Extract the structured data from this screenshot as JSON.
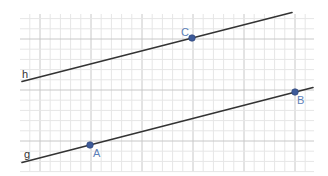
{
  "diagram": {
    "type": "geometry-parallel-lines",
    "grid": {
      "x_start": 20,
      "x_end": 314,
      "y_start": 14,
      "y_end": 172,
      "minor_step": 10.2,
      "major_every": 5,
      "major_x_origin": 40,
      "major_y_origin": 39,
      "minor_color": "#e6e6e6",
      "major_color": "#c8c8c8"
    },
    "lines": [
      {
        "name": "h",
        "label": "h",
        "x1": 22,
        "y1": 81.5,
        "x2": 292,
        "y2": 12.5,
        "label_x": 22,
        "label_y": 78,
        "color": "#333333"
      },
      {
        "name": "g",
        "label": "g",
        "x1": 22,
        "y1": 162.5,
        "x2": 313,
        "y2": 87.5,
        "label_x": 24,
        "label_y": 158,
        "color": "#333333"
      }
    ],
    "points": [
      {
        "name": "A",
        "label": "A",
        "x": 90,
        "y": 145,
        "label_dx": 3,
        "label_dy": 12
      },
      {
        "name": "B",
        "label": "B",
        "x": 295,
        "y": 92,
        "label_dx": 2,
        "label_dy": 12
      },
      {
        "name": "C",
        "label": "C",
        "x": 192,
        "y": 38,
        "label_dx": -11,
        "label_dy": -2
      }
    ],
    "point_color": "#3d5a99",
    "point_label_color": "#5c7fb8"
  }
}
